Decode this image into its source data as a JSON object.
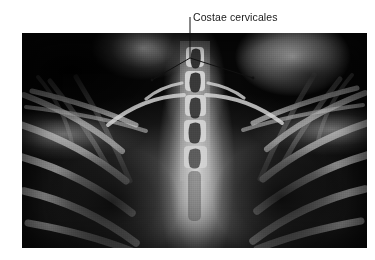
{
  "figure": {
    "type": "radiograph",
    "modality": "X-ray",
    "view": "chest anteroposterior, thoracic inlet / upper thorax",
    "background_color": "#ffffff",
    "annotation": {
      "label": "Costae cervicales",
      "text_color": "#1a1a1a",
      "leader_color": "#111111",
      "leader_style": "vertical stem branching into inverted-V with two pointer tips",
      "points_to": [
        "left cervical rib",
        "right cervical rib"
      ]
    },
    "image_region": {
      "x": 22,
      "y": 33,
      "width": 345,
      "height": 215
    },
    "anatomy_visible": [
      "cervical vertebrae",
      "thoracic vertebrae",
      "cervical ribs",
      "first ribs",
      "clavicles",
      "scapulae",
      "lung fields",
      "trachea",
      "soft tissue of shoulders and neck"
    ]
  }
}
